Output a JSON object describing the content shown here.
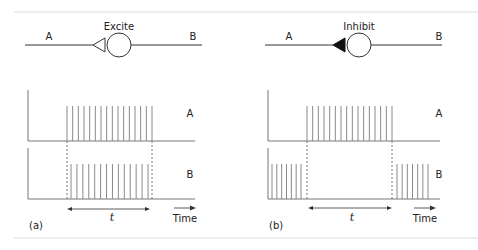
{
  "colors": {
    "line": "#333333",
    "spike": "#8a8a8a",
    "axis": "#777777",
    "separator": "#dddddd",
    "filled_terminal": "#111111"
  },
  "panels": [
    {
      "id": "a",
      "panel_label": "(a)",
      "synapse_label": "Excite",
      "terminal": "open-triangle",
      "neuron_labels": {
        "left": "A",
        "right": "B"
      },
      "raster_labels": {
        "top": "A",
        "bottom": "B"
      },
      "interval_label": "t",
      "time_label": "Time",
      "raster_A": {
        "spikes_during_t": 16,
        "spikes_before_t": 0,
        "spikes_after_t": 0
      },
      "raster_B": {
        "spikes_during_t": 14,
        "spikes_before_t": 0,
        "spikes_after_t": 0
      }
    },
    {
      "id": "b",
      "panel_label": "(b)",
      "synapse_label": "Inhibit",
      "terminal": "filled-triangle",
      "neuron_labels": {
        "left": "A",
        "right": "B"
      },
      "raster_labels": {
        "top": "A",
        "bottom": "B"
      },
      "interval_label": "t",
      "time_label": "Time",
      "raster_A": {
        "spikes_during_t": 16,
        "spikes_before_t": 0,
        "spikes_after_t": 0
      },
      "raster_B": {
        "spikes_during_t": 0,
        "spikes_before_t": 7,
        "spikes_after_t": 7
      }
    }
  ]
}
